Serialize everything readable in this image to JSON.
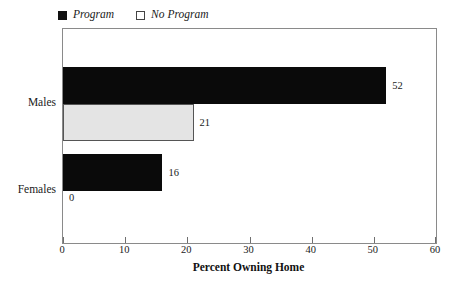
{
  "chart_data": {
    "type": "bar",
    "orientation": "horizontal",
    "title": "",
    "xlabel": "Percent Owning Home",
    "ylabel": "",
    "categories": [
      "Males",
      "Females"
    ],
    "series": [
      {
        "name": "Program",
        "values": [
          52,
          16
        ],
        "color": "#0a0a0a"
      },
      {
        "name": "No Program",
        "values": [
          21,
          0
        ],
        "color": "#e4e4e4"
      }
    ],
    "xlim": [
      0,
      60
    ],
    "xticks": [
      0,
      10,
      20,
      30,
      40,
      50,
      60
    ],
    "xtick_labels": [
      "0",
      "10",
      "20",
      "30",
      "40",
      "50",
      "60"
    ],
    "grid": false,
    "legend_position": "top-left",
    "data_labels": [
      "52",
      "21",
      "16",
      "0"
    ]
  },
  "legend": {
    "items": [
      {
        "label": "Program",
        "swatch": "filled-square-icon"
      },
      {
        "label": "No Program",
        "swatch": "open-square-icon"
      }
    ]
  },
  "axes": {
    "x_title": "Percent Owning Home",
    "x_tick_labels": [
      "0",
      "10",
      "20",
      "30",
      "40",
      "50",
      "60"
    ],
    "y_category_labels": [
      "Males",
      "Females"
    ]
  },
  "bars": [
    {
      "group": "Males",
      "series": "Program",
      "value": 52,
      "label": "52"
    },
    {
      "group": "Males",
      "series": "No Program",
      "value": 21,
      "label": "21"
    },
    {
      "group": "Females",
      "series": "Program",
      "value": 16,
      "label": "16"
    },
    {
      "group": "Females",
      "series": "No Program",
      "value": 0,
      "label": "0"
    }
  ],
  "colors": {
    "program_fill": "#0a0a0a",
    "no_program_fill": "#e4e4e4",
    "no_program_border": "#555555",
    "frame": "#8a8a8a",
    "text": "#1a1a1a",
    "background": "#ffffff"
  }
}
